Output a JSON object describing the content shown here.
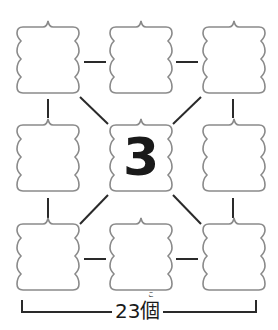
{
  "diagram": {
    "center_value": "3",
    "total_label": "23個",
    "furigana": "こ",
    "box_count": 9,
    "colors": {
      "box_stroke": "#8a8a8a",
      "line": "#2a2a2a",
      "text": "#1a1a1a"
    }
  }
}
